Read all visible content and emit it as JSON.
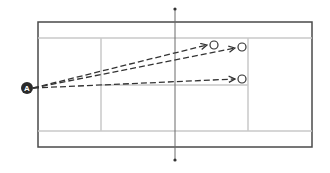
{
  "diagram": {
    "type": "tennis-court-shot-diagram",
    "court": {
      "outer": {
        "x": 38,
        "y": 22,
        "w": 274,
        "h": 125
      },
      "singles_top_y": 38,
      "singles_bottom_y": 131,
      "service_left_x": 101,
      "service_right_x": 248,
      "center_service_y": 85,
      "net_x": 175,
      "net_top_y": 9,
      "net_bottom_y": 160,
      "colors": {
        "outer": "#4a4a4a",
        "inner": "#c8c8c8",
        "net": "#6a6a6a"
      }
    },
    "player": {
      "label": "A",
      "x": 27,
      "y": 88,
      "r": 6,
      "fill": "#2a2a2a",
      "text_color": "#ffffff"
    },
    "shots": [
      {
        "from": [
          33,
          88
        ],
        "to": [
          207,
          45
        ],
        "target": [
          214,
          45
        ]
      },
      {
        "from": [
          33,
          88
        ],
        "to": [
          235,
          48
        ],
        "target": [
          242,
          47
        ]
      },
      {
        "from": [
          33,
          88
        ],
        "to": [
          235,
          79
        ],
        "target": [
          242,
          79
        ]
      }
    ],
    "target_radius": 4,
    "arrow_color": "#333333"
  }
}
